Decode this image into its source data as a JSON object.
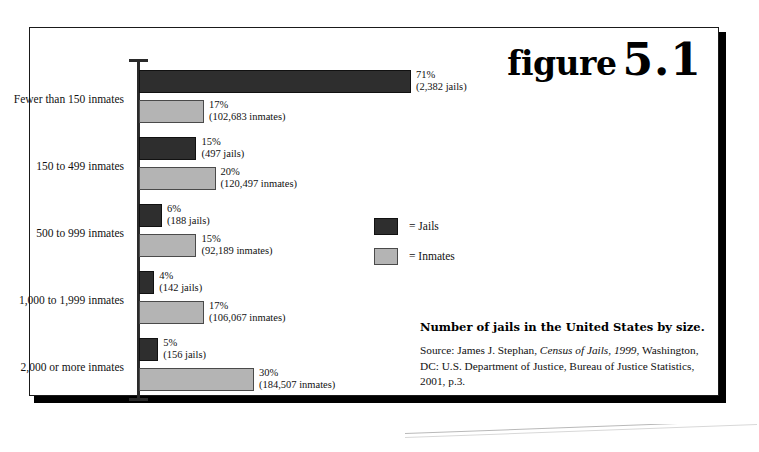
{
  "figure": {
    "word": "figure",
    "number": "5.1"
  },
  "caption": {
    "title": "Number of jails in the United States by size.",
    "source_prefix": "Source: James J. Stephan, ",
    "source_italic": "Census of Jails, 1999",
    "source_suffix": ", Washington, DC: U.S. Department of Justice, Bureau of Justice Statistics, 2001, p.3."
  },
  "legend": {
    "items": [
      {
        "label": "= Jails",
        "color": "#2e2e2e",
        "key": "jails"
      },
      {
        "label": "= Inmates",
        "color": "#b4b4b4",
        "key": "inmates"
      }
    ]
  },
  "chart_data": {
    "type": "bar",
    "orientation": "horizontal",
    "title": "Number of jails in the United States by size.",
    "xlabel": "",
    "ylabel": "",
    "xlim": [
      0,
      71
    ],
    "grid": false,
    "legend_position": "center-right",
    "categories": [
      "Fewer than 150 inmates",
      "150 to 499 inmates",
      "500 to 999 inmates",
      "1,000 to 1,999 inmates",
      "2,000 or more inmates"
    ],
    "series": [
      {
        "name": "Jails",
        "color": "#2e2e2e",
        "values": [
          71,
          15,
          6,
          4,
          5
        ],
        "counts": [
          2382,
          497,
          188,
          142,
          156
        ],
        "labels": [
          "71%",
          "15%",
          "6%",
          "4%",
          "5%"
        ],
        "count_labels": [
          "(2,382 jails)",
          "(497 jails)",
          "(188 jails)",
          "(142 jails)",
          "(156 jails)"
        ]
      },
      {
        "name": "Inmates",
        "color": "#b4b4b4",
        "values": [
          17,
          20,
          15,
          17,
          30
        ],
        "counts": [
          102683,
          120497,
          92189,
          106067,
          184507
        ],
        "labels": [
          "17%",
          "20%",
          "15%",
          "17%",
          "30%"
        ],
        "count_labels": [
          "(102,683 inmates)",
          "(120,497 inmates)",
          "(92,189 inmates)",
          "(106,067 inmates)",
          "(184,507 inmates)"
        ]
      }
    ]
  }
}
